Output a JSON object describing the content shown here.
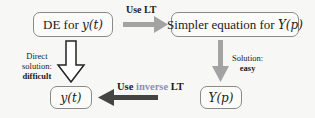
{
  "nodes": {
    "de": {
      "text": "DE for ",
      "math": "y(t)"
    },
    "simpler": {
      "text": "Simpler equation for ",
      "math": "Y(p)"
    },
    "yt": {
      "math": "y(t)"
    },
    "yp": {
      "math": "Y(p)"
    }
  },
  "edges": {
    "use_lt": {
      "label": "Use LT"
    },
    "inverse": {
      "prefix": "Use ",
      "accent": "inverse",
      "suffix": " LT"
    },
    "solution_easy": {
      "line1": "Solution:",
      "line2": "easy"
    },
    "direct": {
      "line1": "Direct",
      "line2": "solution:",
      "line3": "difficult"
    }
  },
  "colors": {
    "arrow_gray": "#a3a3a3",
    "arrow_dark": "#444444",
    "accent": "#8b8fb8",
    "box_border": "#8a8a8a"
  }
}
